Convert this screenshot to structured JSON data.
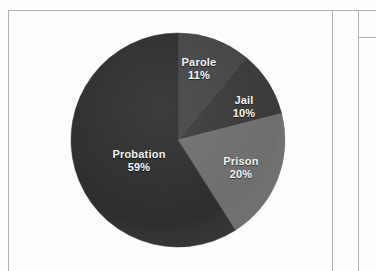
{
  "page": {
    "background_color": "#fdfdfd",
    "frame_color": "#b3b3b3"
  },
  "chart_data": {
    "type": "pie",
    "title": "",
    "subtitle": "",
    "xlabel": "",
    "ylabel": "",
    "legend_position": "none",
    "labels_inside_slices": true,
    "total_percent": 100,
    "categories": [
      "Parole",
      "Jail",
      "Prison",
      "Probation"
    ],
    "values": [
      11,
      10,
      20,
      59
    ],
    "value_suffix": "%",
    "slices": [
      {
        "label": "Parole",
        "value": 11,
        "value_text": "11%",
        "color": "#454545",
        "start_angle_deg": 0,
        "end_angle_deg": 39.6
      },
      {
        "label": "Jail",
        "value": 10,
        "value_text": "10%",
        "color": "#3a3a3a",
        "start_angle_deg": 39.6,
        "end_angle_deg": 75.6
      },
      {
        "label": "Prison",
        "value": 20,
        "value_text": "20%",
        "color": "#6e6e6e",
        "start_angle_deg": 75.6,
        "end_angle_deg": 147.6
      },
      {
        "label": "Probation",
        "value": 59,
        "value_text": "59%",
        "color": "#2e2e2e",
        "start_angle_deg": 147.6,
        "end_angle_deg": 360
      }
    ],
    "geometry": {
      "center_x": 169,
      "center_y": 129,
      "radius": 107
    },
    "label_color": "#f2f2f2"
  }
}
